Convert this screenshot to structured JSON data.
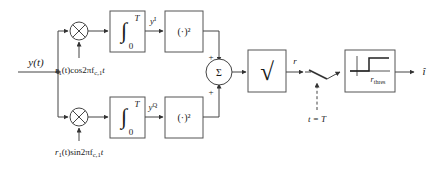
{
  "diagram": {
    "line_color": "#444444",
    "text_color": "#1a1a1a",
    "block_fill": "#ffffff",
    "input": {
      "label": "y(t)",
      "name": "input-signal-label"
    },
    "branches": [
      {
        "id": "in-phase",
        "mixer": {
          "symbol": "⨂",
          "name": "multiplier-i"
        },
        "local_oscillator": {
          "prefix": "r",
          "sub": "1",
          "mid": "(t)cos2πf",
          "sub2": "c,1",
          "suffix": "t",
          "full": "r1(t)cos2πfc,1t"
        },
        "integrator": {
          "symbol": "∫",
          "upper_limit": "T",
          "lower_limit": "0"
        },
        "integrator_output": {
          "base": "y",
          "sup": "I"
        },
        "squarer": {
          "label": "(·)²"
        },
        "sum_sign": "+"
      },
      {
        "id": "quadrature",
        "mixer": {
          "symbol": "⨂",
          "name": "multiplier-q"
        },
        "local_oscillator": {
          "prefix": "r",
          "sub": "1",
          "mid": "(t)sin2πf",
          "sub2": "c,1",
          "suffix": "t",
          "full": "r1(t)sin2πfc,1t"
        },
        "integrator": {
          "symbol": "∫",
          "upper_limit": "T",
          "lower_limit": "0"
        },
        "integrator_output": {
          "base": "y",
          "sup": "Q"
        },
        "squarer": {
          "label": "(·)²"
        },
        "sum_sign": "+"
      }
    ],
    "summer": {
      "symbol": "Σ",
      "name": "summing-junction"
    },
    "sqrt_block": {
      "symbol": "√",
      "name": "square-root-block"
    },
    "envelope_label": "r",
    "sampler": {
      "name": "sampling-switch",
      "trigger_label": "t = T"
    },
    "threshold_block": {
      "name": "threshold-detector-block",
      "threshold_label": {
        "base": "r",
        "sub": "thres"
      }
    },
    "output": {
      "label": "î",
      "base": "i",
      "accent": "^"
    }
  }
}
